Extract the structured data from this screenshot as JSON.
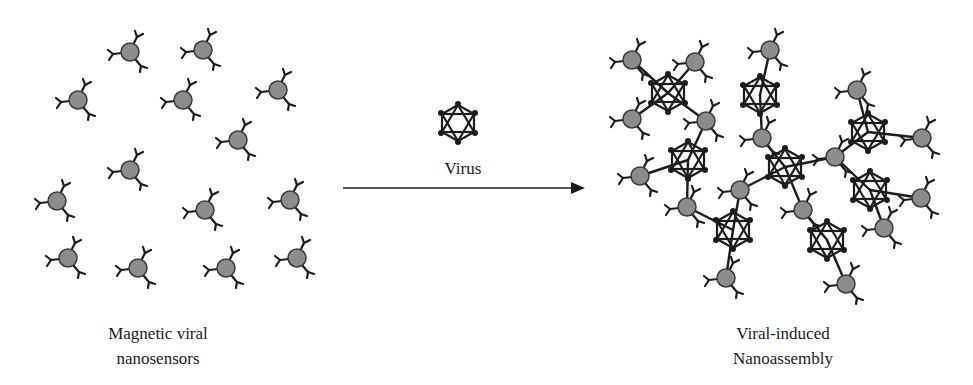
{
  "figure": {
    "colors": {
      "sensor_fill": "#8c8c8c",
      "ink": "#1c1c1c",
      "background": "#ffffff"
    },
    "left_panel": {
      "label_line1": "Magnetic viral",
      "label_line2": "nanosensors",
      "sensors": [
        [
          130,
          52
        ],
        [
          203,
          50
        ],
        [
          78,
          100
        ],
        [
          183,
          100
        ],
        [
          278,
          90
        ],
        [
          238,
          140
        ],
        [
          130,
          170
        ],
        [
          57,
          201
        ],
        [
          205,
          210
        ],
        [
          290,
          200
        ],
        [
          68,
          258
        ],
        [
          138,
          268
        ],
        [
          226,
          268
        ],
        [
          297,
          258
        ]
      ]
    },
    "middle": {
      "virus_label": "Virus",
      "virus_center": [
        458,
        123
      ],
      "arrow": {
        "x1": 343,
        "x2": 585,
        "y": 188
      }
    },
    "right_panel": {
      "label_line1": "Viral-induced",
      "label_line2": "Nanoassembly",
      "viruses": [
        [
          668,
          93
        ],
        [
          760,
          95
        ],
        [
          688,
          160
        ],
        [
          785,
          167
        ],
        [
          868,
          132
        ],
        [
          870,
          190
        ],
        [
          733,
          230
        ],
        [
          827,
          240
        ]
      ],
      "sensors": [
        [
          632,
          60
        ],
        [
          695,
          62
        ],
        [
          770,
          50
        ],
        [
          632,
          119
        ],
        [
          706,
          121
        ],
        [
          762,
          138
        ],
        [
          857,
          90
        ],
        [
          922,
          138
        ],
        [
          835,
          157
        ],
        [
          640,
          176
        ],
        [
          687,
          207
        ],
        [
          740,
          190
        ],
        [
          803,
          210
        ],
        [
          884,
          228
        ],
        [
          921,
          198
        ],
        [
          726,
          278
        ],
        [
          846,
          284
        ]
      ],
      "links": [
        [
          [
            632,
            60
          ],
          [
            668,
            93
          ]
        ],
        [
          [
            695,
            62
          ],
          [
            668,
            93
          ]
        ],
        [
          [
            632,
            119
          ],
          [
            668,
            93
          ]
        ],
        [
          [
            706,
            121
          ],
          [
            668,
            93
          ]
        ],
        [
          [
            770,
            50
          ],
          [
            760,
            95
          ]
        ],
        [
          [
            762,
            138
          ],
          [
            760,
            95
          ]
        ],
        [
          [
            706,
            121
          ],
          [
            688,
            160
          ]
        ],
        [
          [
            640,
            176
          ],
          [
            688,
            160
          ]
        ],
        [
          [
            687,
            207
          ],
          [
            688,
            160
          ]
        ],
        [
          [
            762,
            138
          ],
          [
            785,
            167
          ]
        ],
        [
          [
            835,
            157
          ],
          [
            785,
            167
          ]
        ],
        [
          [
            740,
            190
          ],
          [
            785,
            167
          ]
        ],
        [
          [
            803,
            210
          ],
          [
            785,
            167
          ]
        ],
        [
          [
            857,
            90
          ],
          [
            868,
            132
          ]
        ],
        [
          [
            835,
            157
          ],
          [
            868,
            132
          ]
        ],
        [
          [
            922,
            138
          ],
          [
            868,
            132
          ]
        ],
        [
          [
            835,
            157
          ],
          [
            870,
            190
          ]
        ],
        [
          [
            921,
            198
          ],
          [
            870,
            190
          ]
        ],
        [
          [
            884,
            228
          ],
          [
            870,
            190
          ]
        ],
        [
          [
            687,
            207
          ],
          [
            733,
            230
          ]
        ],
        [
          [
            740,
            190
          ],
          [
            733,
            230
          ]
        ],
        [
          [
            726,
            278
          ],
          [
            733,
            230
          ]
        ],
        [
          [
            803,
            210
          ],
          [
            827,
            240
          ]
        ],
        [
          [
            846,
            284
          ],
          [
            827,
            240
          ]
        ]
      ]
    }
  }
}
